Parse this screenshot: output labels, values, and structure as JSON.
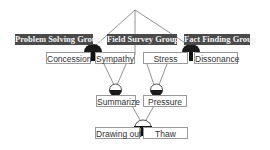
{
  "groups": {
    "problem_solving": "Problem Solving Group",
    "field_survey": "Field Survey Group",
    "fact_finding": "Fact Finding Group"
  },
  "nodes": {
    "concession": "Concession",
    "sympathy": "Sympathy",
    "stress": "Stress",
    "dissonance": "Dissonance",
    "summarize": "Summarize",
    "pressure": "Pressure",
    "drawing_out": "Drawing out",
    "thaw": "Thaw"
  },
  "colors": {
    "group_bg": "#4a4a4a",
    "bulb": "#1a1a1a",
    "line": "#666666"
  }
}
